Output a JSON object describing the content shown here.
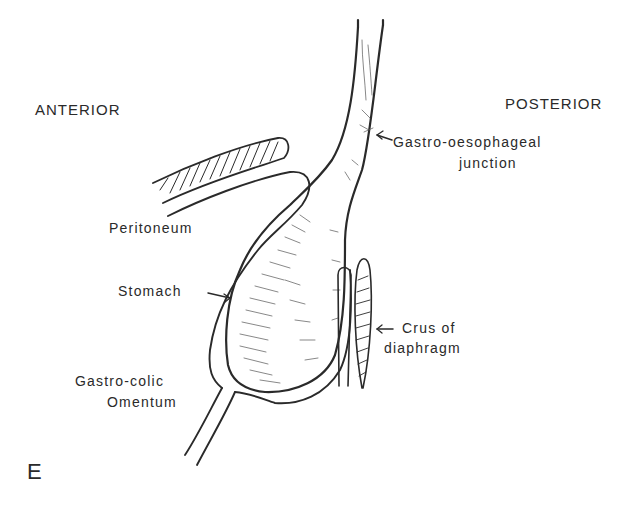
{
  "figure": {
    "panel_letter": "E",
    "orientation": {
      "left": "ANTERIOR",
      "right": "POSTERIOR"
    },
    "labels": {
      "gastro_oesophageal_line1": "Gastro-oesophageal",
      "gastro_oesophageal_line2": "junction",
      "peritoneum": "Peritoneum",
      "stomach": "Stomach",
      "crus_line1": "Crus of",
      "crus_line2": "diaphragm",
      "omentum_line1": "Gastro-colic",
      "omentum_line2": "Omentum"
    },
    "colors": {
      "ink": "#2a2a2a",
      "background": "#ffffff"
    }
  }
}
